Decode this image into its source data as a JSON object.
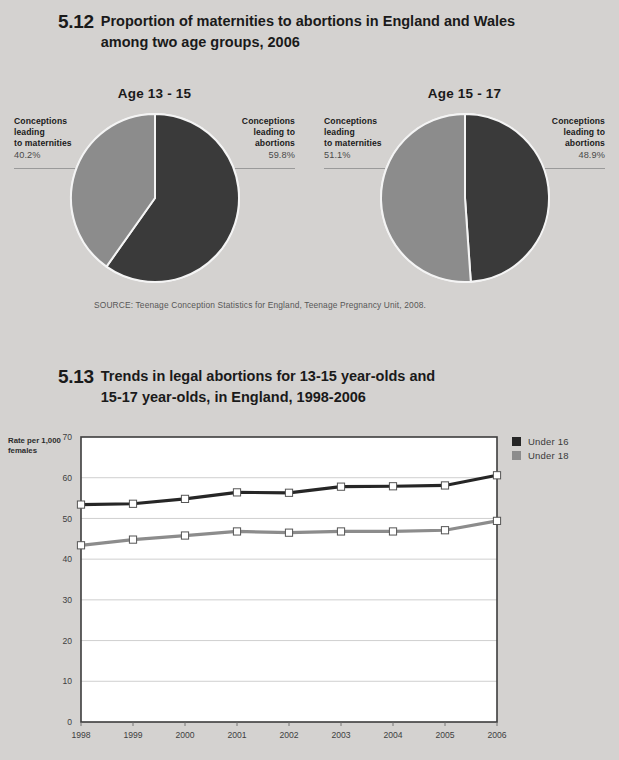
{
  "page": {
    "background_color": "#d4d2d0",
    "dark_color": "#3a3a3a",
    "light_color": "#8c8c8c"
  },
  "figure_512": {
    "number": "5.12",
    "title_line1": "Proportion of maternities to abortions in England and Wales",
    "title_line2": "among two age groups, 2006",
    "source": "SOURCE: Teenage Conception Statistics for England, Teenage Pregnancy Unit, 2008.",
    "panels": [
      {
        "caption": "Age 13 - 15",
        "left_label_line1": "Conceptions",
        "left_label_line2": "leading",
        "left_label_line3": "to maternities",
        "left_value": "40.2%",
        "right_label_line1": "Conceptions",
        "right_label_line2": "leading to",
        "right_label_line3": "abortions",
        "right_value": "59.8%"
      },
      {
        "caption": "Age 15 - 17",
        "left_label_line1": "Conceptions",
        "left_label_line2": "leading",
        "left_label_line3": "to maternities",
        "left_value": "51.1%",
        "right_label_line1": "Conceptions",
        "right_label_line2": "leading to",
        "right_label_line3": "abortions",
        "right_value": "48.9%"
      }
    ]
  },
  "figure_513": {
    "number": "5.13",
    "title_line1": "Trends in legal abortions for 13-15 year-olds and",
    "title_line2": "15-17 year-olds, in England, 1998-2006",
    "y_axis_title_line1": "Rate per 1,000",
    "y_axis_title_line2": "females",
    "legend": [
      {
        "label": "Under 16",
        "color": "#262626"
      },
      {
        "label": "Under 18",
        "color": "#8c8c8c"
      }
    ]
  },
  "chart_data": [
    {
      "type": "pie",
      "title": "Age 13 - 15",
      "labels": [
        "Conceptions leading to abortions",
        "Conceptions leading to maternities"
      ],
      "values": [
        59.8,
        40.2
      ],
      "colors": [
        "#3a3a3a",
        "#8c8c8c"
      ],
      "units": "percent",
      "legend": "none"
    },
    {
      "type": "pie",
      "title": "Age 15 - 17",
      "labels": [
        "Conceptions leading to abortions",
        "Conceptions leading to maternities"
      ],
      "values": [
        48.9,
        51.1
      ],
      "colors": [
        "#3a3a3a",
        "#8c8c8c"
      ],
      "units": "percent",
      "legend": "none"
    },
    {
      "type": "line",
      "title": "Trends in legal abortions for 13-15 year-olds and 15-17 year-olds, in England, 1998-2006",
      "xlabel": "",
      "ylabel": "Rate per 1,000 females",
      "x": [
        1998,
        1999,
        2000,
        2001,
        2002,
        2003,
        2004,
        2005,
        2006
      ],
      "ylim": [
        0,
        70
      ],
      "yticks": [
        0,
        10,
        20,
        30,
        40,
        50,
        60,
        70
      ],
      "grid": "horizontal",
      "legend": "top-right",
      "series": [
        {
          "name": "Under 16",
          "color": "#262626",
          "values": [
            53.4,
            53.6,
            54.8,
            56.4,
            56.3,
            57.8,
            57.9,
            58.1,
            60.6
          ]
        },
        {
          "name": "Under 18",
          "color": "#8c8c8c",
          "values": [
            43.4,
            44.8,
            45.8,
            46.8,
            46.5,
            46.8,
            46.8,
            47.1,
            49.4
          ]
        }
      ]
    }
  ]
}
